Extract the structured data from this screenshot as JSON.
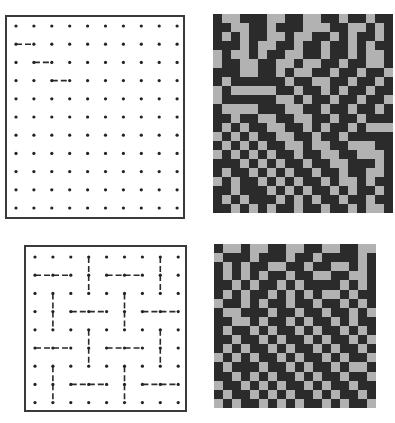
{
  "figure": {
    "panels": [
      {
        "id": "top-left",
        "type": "dot-grid",
        "cols": 10,
        "rows": 11,
        "segments": [
          {
            "from": [
              0,
              1
            ],
            "to": [
              1,
              1
            ]
          },
          {
            "from": [
              1,
              2
            ],
            "to": [
              2,
              2
            ]
          },
          {
            "from": [
              2,
              3
            ],
            "to": [
              3,
              3
            ]
          }
        ]
      },
      {
        "id": "top-right",
        "type": "maze-pattern",
        "cols": 20,
        "rows": 22,
        "colors": {
          "dark": "#2b2b2b",
          "light": "#b2b2b2"
        },
        "grid": [
          "10011100110011011011",
          "11001101110001100101",
          "10101100100110101101",
          "11101001101101101011",
          "01001011001101101001",
          "01100110010011011001",
          "11100110100110110110",
          "10111111011001101101",
          "01000001101101011011",
          "01111110010110110110",
          "10000111001101101101",
          "11011001100110110111",
          "10101100110101101000",
          "01010110011011011111",
          "10101011001001100011",
          "01010101101100110001",
          "11101010110110011101",
          "10110101011011011001",
          "01011010101101001011",
          "11011101010110101101",
          "10101110101011011011",
          "11010101101101101001"
        ]
      },
      {
        "id": "bottom-left",
        "type": "dot-grid",
        "cols": 9,
        "rows": 9,
        "segments": [
          {
            "from": [
              0,
              1
            ],
            "to": [
              2,
              1
            ]
          },
          {
            "from": [
              3,
              0
            ],
            "to": [
              3,
              2
            ]
          },
          {
            "from": [
              4,
              1
            ],
            "to": [
              6,
              1
            ]
          },
          {
            "from": [
              7,
              0
            ],
            "to": [
              7,
              2
            ]
          },
          {
            "from": [
              1,
              2
            ],
            "to": [
              1,
              4
            ]
          },
          {
            "from": [
              2,
              3
            ],
            "to": [
              4,
              3
            ]
          },
          {
            "from": [
              5,
              2
            ],
            "to": [
              5,
              4
            ]
          },
          {
            "from": [
              6,
              3
            ],
            "to": [
              8,
              3
            ]
          },
          {
            "from": [
              0,
              5
            ],
            "to": [
              2,
              5
            ]
          },
          {
            "from": [
              3,
              4
            ],
            "to": [
              3,
              6
            ]
          },
          {
            "from": [
              4,
              5
            ],
            "to": [
              6,
              5
            ]
          },
          {
            "from": [
              7,
              4
            ],
            "to": [
              7,
              6
            ]
          },
          {
            "from": [
              1,
              6
            ],
            "to": [
              1,
              8
            ]
          },
          {
            "from": [
              2,
              7
            ],
            "to": [
              4,
              7
            ]
          },
          {
            "from": [
              5,
              6
            ],
            "to": [
              5,
              8
            ]
          },
          {
            "from": [
              6,
              7
            ],
            "to": [
              8,
              7
            ]
          }
        ]
      },
      {
        "id": "bottom-right",
        "type": "maze-pattern",
        "cols": 18,
        "rows": 18,
        "colors": {
          "dark": "#2b2b2b",
          "light": "#b2b2b2"
        },
        "grid": [
          "100100110011001100",
          "011101110110111101",
          "101011001101100101",
          "101010110110011001",
          "110101101011110101",
          "101011010101001011",
          "011010110110110101",
          "100111011011011010",
          "110010110101101011",
          "101101011010110101",
          "110110101101011010",
          "101011010110101101",
          "010101101011010110",
          "101110110101101001",
          "110101011010110110",
          "011010101101011011",
          "101101010110101101",
          "010110101011010110"
        ]
      }
    ]
  }
}
